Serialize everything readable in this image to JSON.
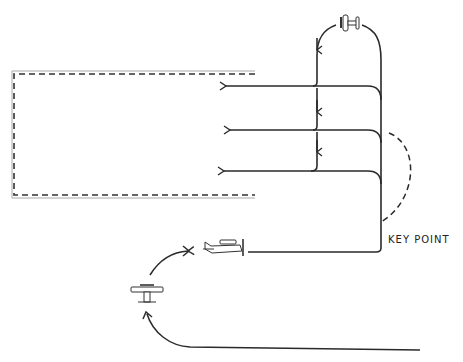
{
  "diagram": {
    "type": "flight-pattern",
    "labels": {
      "key_point": "KEY POINT"
    },
    "elements": {
      "landing_area": "dashed rectangle (runway/landing area)",
      "overhead_aircraft": "aircraft top of loop",
      "approach_lanes": 3,
      "side_view_aircraft": "aircraft on base leg",
      "front_view_aircraft": "aircraft turning",
      "alternate_path": "dashed curve"
    },
    "colors": {
      "stroke": "#2a2a2a",
      "outline": "#9a9a9a"
    }
  }
}
